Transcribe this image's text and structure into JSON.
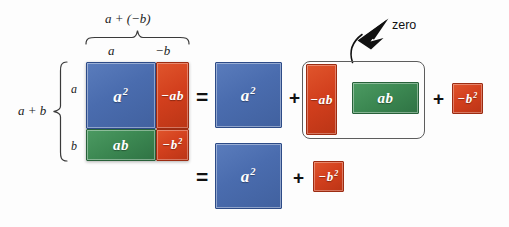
{
  "figure": {
    "title_expression": "a + (-b)",
    "left_expression": "a + b",
    "background_color": "#fdfdfd"
  },
  "colors": {
    "blue": "#4a6cae",
    "red": "#d23f1d",
    "green": "#3c8852",
    "outline": "#5d5d5d",
    "text": "#111111"
  },
  "top_labels": {
    "sum": "a + (−b)",
    "part_a": "a",
    "part_neg_b": "−b"
  },
  "left_labels": {
    "sum": "a + b",
    "part_a": "a",
    "part_b": "b"
  },
  "grid": {
    "cells": [
      {
        "label": "a",
        "exponent": "2",
        "color": "blue",
        "name": "a-squared"
      },
      {
        "label": "−ab",
        "exponent": "",
        "color": "red",
        "name": "negative-ab"
      },
      {
        "label": "ab",
        "exponent": "",
        "color": "green",
        "name": "ab"
      },
      {
        "label": "−b",
        "exponent": "2",
        "color": "red",
        "name": "negative-b-squared"
      }
    ]
  },
  "row_top": {
    "equals": "=",
    "a_squared": {
      "label": "a",
      "exponent": "2"
    },
    "plus_1": "+",
    "neg_ab": {
      "label": "−ab",
      "exponent": ""
    },
    "ab": {
      "label": "ab",
      "exponent": ""
    },
    "plus_2": "+",
    "neg_b_squared": {
      "label": "−b",
      "exponent": "2"
    }
  },
  "row_bottom": {
    "equals": "=",
    "a_squared": {
      "label": "a",
      "exponent": "2"
    },
    "plus": "+",
    "neg_b_squared": {
      "label": "−b",
      "exponent": "2"
    }
  },
  "annotation": {
    "zero_label": "zero"
  }
}
